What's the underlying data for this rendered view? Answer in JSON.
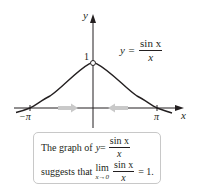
{
  "chart_data": {
    "type": "line",
    "title": "",
    "function": "y = sin x / x",
    "xlabel": "x",
    "ylabel": "y",
    "x_ticks": [
      "−π",
      "π"
    ],
    "y_ticks": [
      "1"
    ],
    "xlim": [
      -3.5,
      3.8
    ],
    "ylim": [
      -0.3,
      2.1
    ],
    "grid": false,
    "legend": null,
    "series": [
      {
        "name": "sin x / x",
        "x": [
          -3.46,
          -3.14159,
          -2.5,
          -2.0,
          -1.5,
          -1.0,
          -0.5,
          0,
          0.5,
          1.0,
          1.5,
          2.0,
          2.5,
          3.14159,
          3.46
        ],
        "y": [
          -0.091,
          0.0,
          0.239,
          0.455,
          0.665,
          0.841,
          0.959,
          1.0,
          0.959,
          0.841,
          0.665,
          0.455,
          0.239,
          0.0,
          -0.091
        ]
      }
    ],
    "annotations": [
      {
        "type": "hole",
        "x": 0,
        "y": 1,
        "note": "open circle at (0,1)"
      },
      {
        "type": "arrow",
        "direction": "right",
        "from_x": -1.7,
        "to_x": -0.6,
        "y": 0,
        "note": "x → 0 from left"
      },
      {
        "type": "arrow",
        "direction": "left",
        "from_x": 1.7,
        "to_x": 0.6,
        "y": 0,
        "note": "x → 0 from right"
      }
    ]
  },
  "labels": {
    "y_axis": "y",
    "x_axis": "x",
    "y_tick_1": "1",
    "x_tick_neg_pi": "−π",
    "x_tick_pi": "π",
    "eq_prefix": "y =",
    "eq_num": "sin x",
    "eq_den": "x"
  },
  "caption": {
    "line1_prefix": "The graph of",
    "line1_y": "y",
    "line1_eq": " =",
    "line1_num": "sin x",
    "line1_den": "x",
    "line2_prefix": "suggests that",
    "lim_word": "lim",
    "lim_sub": "x→0",
    "line2_num": "sin x",
    "line2_den": "x",
    "line2_suffix": "= 1."
  },
  "colors": {
    "curve": "#231f20",
    "axis": "#231f20",
    "arrow_fill": "#c9c9c9",
    "box_border": "#c8c8c8"
  }
}
